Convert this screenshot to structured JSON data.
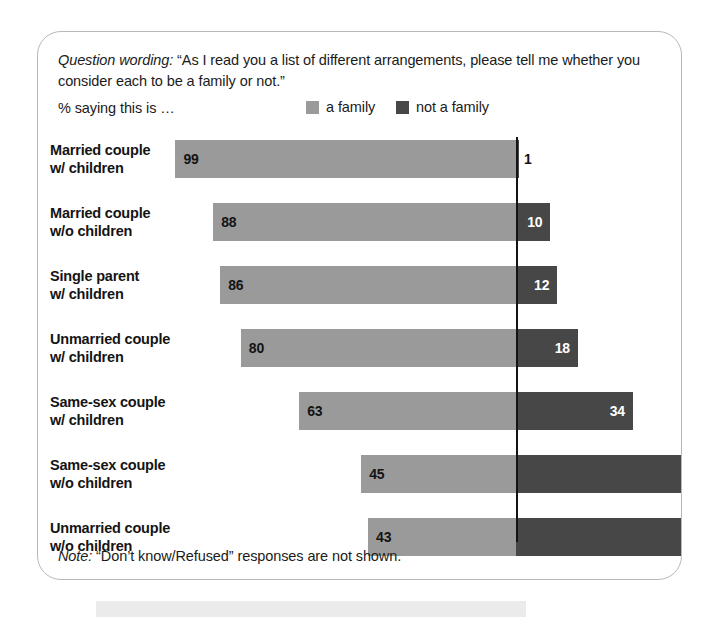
{
  "panel": {
    "question_label": "Question wording:",
    "question_text": "“As I read you a list of different arrangements, please tell me whether you consider each to be a family or not.”",
    "pct_saying": "% saying this is …",
    "note_label": "Note:",
    "note_text": "“Don’t know/Refused” responses are not shown."
  },
  "legend": [
    {
      "label": "a family",
      "color": "#9a9a9a",
      "swatch_name": "legend-swatch-a-family"
    },
    {
      "label": "not a family",
      "color": "#474747",
      "swatch_name": "legend-swatch-not-a-family"
    }
  ],
  "chart_data": {
    "type": "bar",
    "title": "% saying this is …",
    "subtitle": "“As I read you a list of different arrangements, please tell me whether you consider each to be a family or not.”",
    "orientation": "horizontal",
    "stacked": true,
    "alignment": "a-family segment right-aligned to shared reference line at 0 offset",
    "xlabel": "",
    "ylabel": "",
    "grid": false,
    "legend_position": "top-right",
    "reference_line": {
      "value": 0,
      "color": "#141414"
    },
    "categories": [
      "Married couple w/ children",
      "Married couple w/o children",
      "Single parent w/ children",
      "Unmarried couple w/ children",
      "Same-sex couple w/ children",
      "Same-sex couple w/o children",
      "Unmarried couple w/o children"
    ],
    "category_lines": [
      [
        "Married couple",
        "w/ children"
      ],
      [
        "Married couple",
        "w/o children"
      ],
      [
        "Single parent",
        "w/ children"
      ],
      [
        "Unmarried couple",
        "w/ children"
      ],
      [
        "Same-sex couple",
        "w/ children"
      ],
      [
        "Same-sex couple",
        "w/o children"
      ],
      [
        "Unmarried couple",
        "w/o children"
      ]
    ],
    "series": [
      {
        "name": "a family",
        "color": "#9a9a9a",
        "values": [
          99,
          88,
          86,
          80,
          63,
          45,
          43
        ]
      },
      {
        "name": "not a family",
        "color": "#474747",
        "values": [
          1,
          10,
          12,
          18,
          34,
          null,
          null
        ]
      }
    ]
  },
  "rows": [
    {
      "line1": "Married couple",
      "line2": "w/ children",
      "family": {
        "value": 99,
        "label": "99"
      },
      "notfamily": {
        "value": 1,
        "label": "1",
        "label_outside": true
      }
    },
    {
      "line1": "Married couple",
      "line2": "w/o children",
      "family": {
        "value": 88,
        "label": "88"
      },
      "notfamily": {
        "value": 10,
        "label": "10",
        "label_outside": false
      }
    },
    {
      "line1": "Single parent",
      "line2": "w/ children",
      "family": {
        "value": 86,
        "label": "86"
      },
      "notfamily": {
        "value": 12,
        "label": "12",
        "label_outside": false
      }
    },
    {
      "line1": "Unmarried couple",
      "line2": "w/ children",
      "family": {
        "value": 80,
        "label": "80"
      },
      "notfamily": {
        "value": 18,
        "label": "18",
        "label_outside": false
      }
    },
    {
      "line1": "Same-sex couple",
      "line2": "w/ children",
      "family": {
        "value": 63,
        "label": "63"
      },
      "notfamily": {
        "value": 34,
        "label": "34",
        "label_outside": false
      }
    },
    {
      "line1": "Same-sex couple",
      "line2": "w/o children",
      "family": {
        "value": 45,
        "label": "45"
      },
      "notfamily": {
        "value": null,
        "label": "",
        "label_outside": false
      }
    },
    {
      "line1": "Unmarried couple",
      "line2": "w/o children",
      "family": {
        "value": 43,
        "label": "43"
      },
      "notfamily": {
        "value": null,
        "label": "",
        "label_outside": false
      }
    }
  ],
  "geometry": {
    "px_per_unit": 3.44,
    "zero_x": 478,
    "row_top": 108,
    "row_pitch": 63,
    "bar_height": 38,
    "default_notfamily_px": 187
  }
}
